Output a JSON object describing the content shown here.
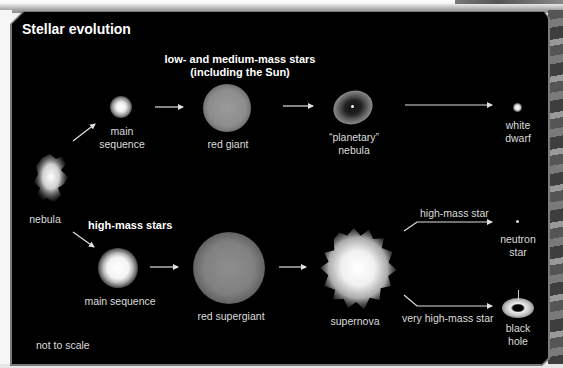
{
  "title": "Stellar evolution",
  "note": "not to scale",
  "start": {
    "label": "nebula"
  },
  "branches": {
    "low_medium": {
      "heading_line1": "low- and medium-mass stars",
      "heading_line2": "(including the Sun)",
      "stages": [
        {
          "id": "main-sequence",
          "label_line1": "main",
          "label_line2": "sequence"
        },
        {
          "id": "red-giant",
          "label_line1": "red giant",
          "label_line2": ""
        },
        {
          "id": "planetary-nebula",
          "label_line1": "“planetary”",
          "label_line2": "nebula"
        },
        {
          "id": "white-dwarf",
          "label_line1": "white",
          "label_line2": "dwarf"
        }
      ]
    },
    "high": {
      "heading": "high-mass stars",
      "stages": [
        {
          "id": "main-sequence",
          "label": "main sequence"
        },
        {
          "id": "red-supergiant",
          "label": "red supergiant"
        },
        {
          "id": "supernova",
          "label": "supernova"
        }
      ],
      "outcomes": [
        {
          "condition": "high-mass star",
          "label_line1": "neutron",
          "label_line2": "star"
        },
        {
          "condition": "very high-mass star",
          "label_line1": "black",
          "label_line2": "hole"
        }
      ]
    }
  },
  "colors": {
    "background": "#000000",
    "text": "#dcdcdc",
    "heading": "#ffffff",
    "arrow": "#e0e0e0"
  }
}
